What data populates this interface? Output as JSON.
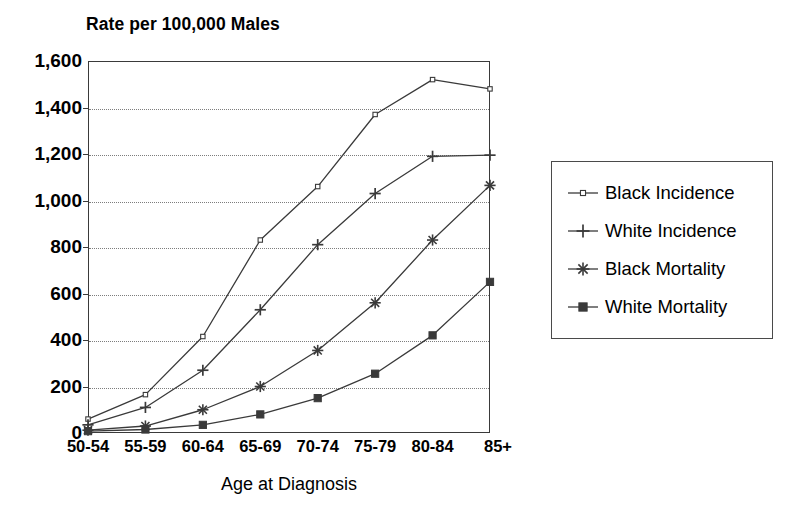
{
  "chart_data": {
    "type": "line",
    "title": "Rate per 100,000 Males",
    "xlabel": "Age at Diagnosis",
    "ylabel": "Rate per 100,000 Males",
    "categories": [
      "50-54",
      "55-59",
      "60-64",
      "65-69",
      "70-74",
      "75-79",
      "80-84",
      "85+"
    ],
    "ylim": [
      0,
      1600
    ],
    "ytick_values": [
      0,
      200,
      400,
      600,
      800,
      1000,
      1200,
      1400,
      1600
    ],
    "ytick_labels": [
      "0",
      "200",
      "400",
      "600",
      "800",
      "1,000",
      "1,200",
      "1,400",
      "1,600"
    ],
    "grid": true,
    "grid_style": "dotted-horizontal",
    "legend_position": "right",
    "series": [
      {
        "name": "Black Incidence",
        "marker": "dot",
        "values": [
          60,
          165,
          415,
          830,
          1060,
          1370,
          1520,
          1480
        ]
      },
      {
        "name": "White Incidence",
        "marker": "plus",
        "values": [
          35,
          110,
          270,
          530,
          810,
          1030,
          1190,
          1195
        ]
      },
      {
        "name": "Black Mortality",
        "marker": "asterisk",
        "values": [
          12,
          30,
          100,
          200,
          355,
          560,
          830,
          1065
        ]
      },
      {
        "name": "White Mortality",
        "marker": "square",
        "values": [
          8,
          15,
          35,
          80,
          150,
          255,
          420,
          650
        ]
      }
    ]
  },
  "colors": {
    "line": "#3a3a3a",
    "grid": "#7d7d7d",
    "frame": "#3a3a3a",
    "text": "#000000",
    "background": "#ffffff"
  },
  "legend": {
    "items": [
      {
        "label": "Black Incidence",
        "marker": "dot"
      },
      {
        "label": "White Incidence",
        "marker": "plus"
      },
      {
        "label": "Black Mortality",
        "marker": "asterisk"
      },
      {
        "label": "White Mortality",
        "marker": "square"
      }
    ]
  }
}
